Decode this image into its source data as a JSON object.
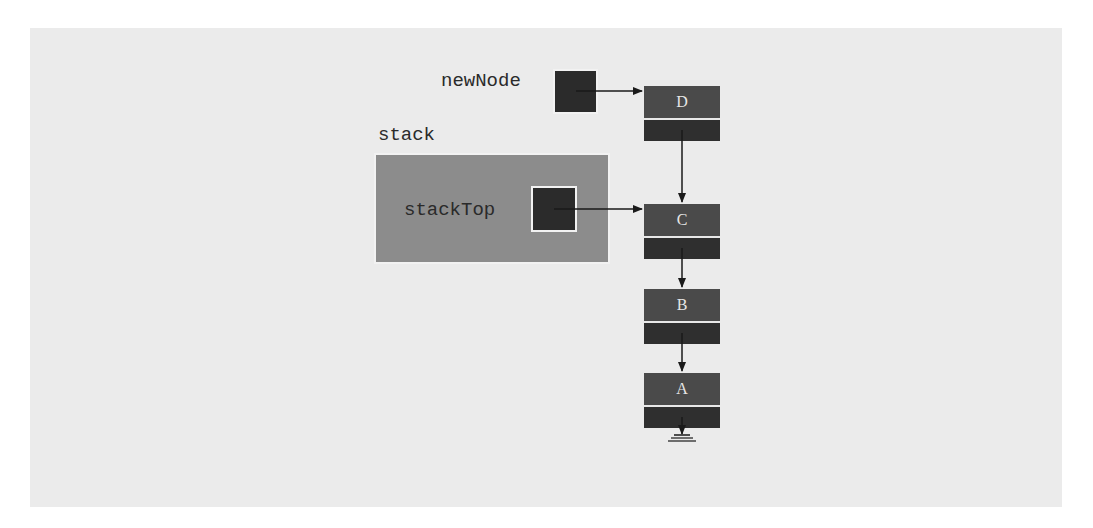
{
  "diagram": {
    "labels": {
      "new_node": "newNode",
      "stack": "stack",
      "stack_top": "stackTop"
    },
    "nodes": [
      {
        "id": "D",
        "label": "D"
      },
      {
        "id": "C",
        "label": "C"
      },
      {
        "id": "B",
        "label": "B"
      },
      {
        "id": "A",
        "label": "A"
      }
    ],
    "edges": [
      {
        "from": "newNode",
        "to": "D"
      },
      {
        "from": "stackTop",
        "to": "C"
      },
      {
        "from": "D",
        "to": "C"
      },
      {
        "from": "C",
        "to": "B"
      },
      {
        "from": "B",
        "to": "A"
      },
      {
        "from": "A",
        "to": "null"
      }
    ],
    "colors": {
      "background_panel": "#ebebeb",
      "stack_panel": "#8c8c8c",
      "pointer_box": "#2b2b2b",
      "node_data": "#4a4a4a",
      "node_next": "#2f2f2f",
      "arrow": "#1a1a1a"
    }
  }
}
